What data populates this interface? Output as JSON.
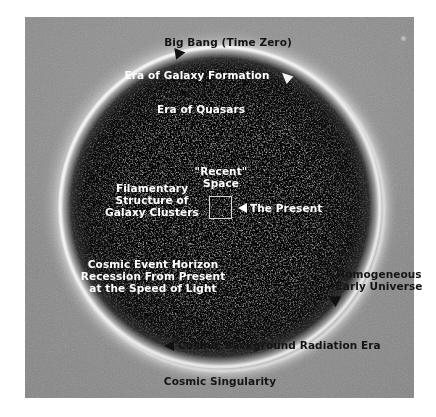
{
  "figure": {
    "kind": "cosmology-sphere-diagram",
    "background_color": "#ffffff",
    "plate_color": "#8e8e8e",
    "sphere_interior_color": "#000000",
    "sphere_rim_color": "#ffffff",
    "label_dark_color": "#141414",
    "label_light_color": "#ffffff"
  },
  "labels": {
    "big_bang": "Big Bang (Time Zero)",
    "era_galaxy_formation": "Era of Galaxy Formation",
    "era_of_quasars": "Era of Quasars",
    "recent_space_line1": "\"Recent\"",
    "recent_space_line2": "Space",
    "the_present": "The Present",
    "filamentary_line1": "Filamentary",
    "filamentary_line2": "Structure of",
    "filamentary_line3": "Galaxy Clusters",
    "event_horizon_line1": "Cosmic Event Horizon",
    "event_horizon_line2": "Recession From Present",
    "event_horizon_line3": "at the Speed of Light",
    "homogeneous_line1": "Homogeneous",
    "homogeneous_line2": "Early Universe",
    "cosmic_background": "Cosmic Background Radiation Era",
    "cosmic_singularity": "Cosmic Singularity"
  },
  "icons": {
    "arrow_big_bang": "triangle-arrow-down-right-black",
    "arrow_galaxy_formation": "triangle-arrow-down-right-white",
    "arrow_present": "triangle-arrow-left-white",
    "arrow_homogeneous": "triangle-arrow-down-left-black",
    "arrow_cosmic_background": "triangle-arrow-left-black",
    "recent_space_marker": "square-outline-marker",
    "plate_speck": "light-speck"
  }
}
